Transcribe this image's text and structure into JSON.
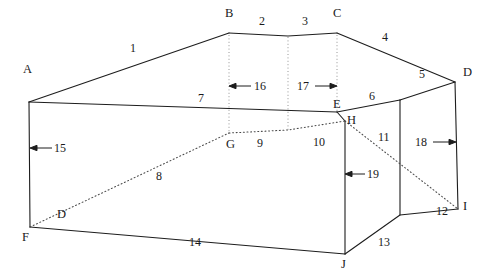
{
  "diagram": {
    "stroke_color": "#1d1d1d",
    "dotted_color": "#4a4a4a",
    "background": "#ffffff",
    "vertices": [
      {
        "id": "A",
        "label": "A",
        "x": 29,
        "y": 102,
        "label_x": 23,
        "label_y": 70
      },
      {
        "id": "B",
        "label": "B",
        "x": 229,
        "y": 33,
        "label_x": 225,
        "label_y": 13
      },
      {
        "id": "C",
        "label": "C",
        "x": 337,
        "y": 33,
        "label_x": 333,
        "label_y": 13
      },
      {
        "id": "D",
        "label": "D",
        "x": 455,
        "y": 82,
        "label_x": 463,
        "label_y": 65
      },
      {
        "id": "E",
        "label": "E",
        "x": 337,
        "y": 112,
        "label_x": 334,
        "label_y": 97
      },
      {
        "id": "F",
        "label": "F",
        "x": 30,
        "y": 227,
        "label_x": 22,
        "label_y": 231
      },
      {
        "id": "G",
        "label": "G",
        "x": 229,
        "y": 133,
        "label_x": 227,
        "label_y": 137
      },
      {
        "id": "H",
        "label": "H",
        "x": 345,
        "y": 121,
        "label_x": 348,
        "label_y": 112
      },
      {
        "id": "I",
        "label": "I",
        "x": 458,
        "y": 209,
        "label_x": 464,
        "label_y": 196
      },
      {
        "id": "J",
        "label": "J",
        "x": 345,
        "y": 254,
        "label_x": 341,
        "label_y": 258
      },
      {
        "id": "D2",
        "label": "D",
        "x": 60,
        "y": 219,
        "label_x": 58,
        "label_y": 206
      }
    ],
    "edge_labels": [
      {
        "id": "e1",
        "text": "1",
        "x": 133,
        "y": 48
      },
      {
        "id": "e2",
        "text": "2",
        "x": 262,
        "y": 20
      },
      {
        "id": "e3",
        "text": "3",
        "x": 305,
        "y": 20
      },
      {
        "id": "e4",
        "text": "4",
        "x": 385,
        "y": 37
      },
      {
        "id": "e5",
        "text": "5",
        "x": 422,
        "y": 74
      },
      {
        "id": "e6",
        "text": "6",
        "x": 371,
        "y": 96
      },
      {
        "id": "e7",
        "text": "7",
        "x": 200,
        "y": 98
      },
      {
        "id": "e8",
        "text": "8",
        "x": 158,
        "y": 176
      },
      {
        "id": "e9",
        "text": "9",
        "x": 259,
        "y": 143
      },
      {
        "id": "e10",
        "text": "10",
        "x": 317,
        "y": 142
      },
      {
        "id": "e11",
        "text": "11",
        "x": 382,
        "y": 137
      },
      {
        "id": "e12",
        "text": "12",
        "x": 440,
        "y": 211
      },
      {
        "id": "e13",
        "text": "13",
        "x": 382,
        "y": 242
      },
      {
        "id": "e14",
        "text": "14",
        "x": 193,
        "y": 242
      }
    ],
    "dimension_labels": [
      {
        "id": "d15",
        "text": "15",
        "x": 57,
        "y": 148
      },
      {
        "id": "d16",
        "text": "16",
        "x": 258,
        "y": 86
      },
      {
        "id": "d17",
        "text": "17",
        "x": 301,
        "y": 86
      },
      {
        "id": "d18",
        "text": "18",
        "x": 419,
        "y": 142
      },
      {
        "id": "d19",
        "text": "19",
        "x": 370,
        "y": 175
      }
    ]
  }
}
